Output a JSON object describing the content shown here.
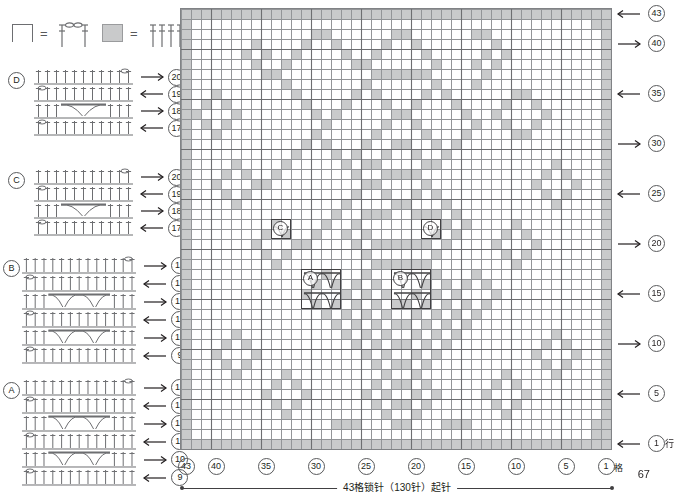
{
  "page": {
    "number": "67"
  },
  "legend": {
    "items": [
      {
        "symbol_name": "open-square-symbol",
        "equals": "=",
        "stitch_name": "chain-and-double-crochet-group"
      },
      {
        "symbol_name": "filled-square-symbol",
        "equals": "=",
        "stitch_name": "four-double-crochet-group"
      }
    ]
  },
  "diagrams": [
    {
      "id": "D",
      "label": "D",
      "rows": [
        {
          "num": "20",
          "dir": "right"
        },
        {
          "num": "19",
          "dir": "left"
        },
        {
          "num": "18",
          "dir": "right"
        },
        {
          "num": "17",
          "dir": "left"
        }
      ]
    },
    {
      "id": "C",
      "label": "C",
      "rows": [
        {
          "num": "20",
          "dir": "right"
        },
        {
          "num": "19",
          "dir": "left"
        },
        {
          "num": "18",
          "dir": "right"
        },
        {
          "num": "17",
          "dir": "left"
        }
      ]
    },
    {
      "id": "B",
      "label": "B",
      "rows": [
        {
          "num": "14",
          "dir": "right"
        },
        {
          "num": "13",
          "dir": "left"
        },
        {
          "num": "12",
          "dir": "right"
        },
        {
          "num": "11",
          "dir": "left"
        },
        {
          "num": "10",
          "dir": "right"
        },
        {
          "num": "9",
          "dir": "left"
        }
      ]
    },
    {
      "id": "A",
      "label": "A",
      "rows": [
        {
          "num": "14",
          "dir": "right"
        },
        {
          "num": "13",
          "dir": "left"
        },
        {
          "num": "12",
          "dir": "right"
        },
        {
          "num": "11",
          "dir": "left"
        },
        {
          "num": "10",
          "dir": "right"
        },
        {
          "num": "9",
          "dir": "left"
        }
      ]
    }
  ],
  "chart_grid": {
    "columns": 43,
    "rows": 44,
    "cell_px": 10,
    "fill_color": "#c9cacb",
    "line_color": "#939598",
    "border_color": "#808285",
    "row_numbers_right": [
      {
        "num": "43",
        "row": 44,
        "dir": "left"
      },
      {
        "num": "40",
        "row": 41,
        "dir": "right"
      },
      {
        "num": "35",
        "row": 36,
        "dir": "left"
      },
      {
        "num": "30",
        "row": 31,
        "dir": "right"
      },
      {
        "num": "25",
        "row": 26,
        "dir": "left"
      },
      {
        "num": "20",
        "row": 21,
        "dir": "right"
      },
      {
        "num": "15",
        "row": 16,
        "dir": "left"
      },
      {
        "num": "10",
        "row": 11,
        "dir": "right"
      },
      {
        "num": "5",
        "row": 6,
        "dir": "left"
      },
      {
        "num": "1",
        "row": 1,
        "dir": "left",
        "suffix": "行"
      }
    ],
    "column_numbers_bottom": [
      {
        "num": "43",
        "col": 43
      },
      {
        "num": "40",
        "col": 40
      },
      {
        "num": "35",
        "col": 35
      },
      {
        "num": "30",
        "col": 30
      },
      {
        "num": "25",
        "col": 25
      },
      {
        "num": "20",
        "col": 20
      },
      {
        "num": "15",
        "col": 15
      },
      {
        "num": "10",
        "col": 10
      },
      {
        "num": "5",
        "col": 5
      },
      {
        "num": "1",
        "col": 1,
        "suffix": "格"
      }
    ],
    "insets": [
      {
        "id": "D",
        "label": "D",
        "col": 18,
        "row": 22,
        "w": 2,
        "h": 2,
        "pattern": "single-arch"
      },
      {
        "id": "C",
        "label": "C",
        "col": 33,
        "row": 22,
        "w": 2,
        "h": 2,
        "pattern": "single-arch"
      },
      {
        "id": "B",
        "label": "B",
        "col": 19,
        "row": 15,
        "w": 4,
        "h": 4,
        "pattern": "double-arch"
      },
      {
        "id": "A",
        "label": "A",
        "col": 28,
        "row": 15,
        "w": 4,
        "h": 4,
        "pattern": "double-arch"
      }
    ],
    "filled_cells_by_row": {
      "44": [
        1,
        2,
        3,
        4,
        5,
        6,
        7,
        8,
        9,
        10,
        11,
        12,
        13,
        14,
        15,
        16,
        17,
        18,
        19,
        20,
        21,
        22,
        23,
        24,
        25,
        26,
        27,
        28,
        29,
        30,
        31,
        32,
        33,
        34,
        35,
        36,
        37,
        38,
        39,
        40,
        41,
        42,
        43
      ],
      "43": [
        1,
        2,
        43
      ],
      "42": [
        1,
        13,
        14,
        21,
        22,
        29,
        30,
        43
      ],
      "41": [
        1,
        12,
        20,
        23,
        28,
        31,
        36,
        43
      ],
      "40": [
        1,
        11,
        13,
        19,
        24,
        27,
        32,
        35,
        37,
        43
      ],
      "39": [
        1,
        12,
        14,
        18,
        25,
        26,
        33,
        36,
        43
      ],
      "38": [
        1,
        13,
        19,
        20,
        21,
        22,
        23,
        24,
        34,
        35,
        43
      ],
      "37": [
        1,
        14,
        18,
        25,
        33,
        43
      ],
      "36": [
        1,
        9,
        10,
        17,
        19,
        24,
        26,
        32,
        40,
        43
      ],
      "35": [
        1,
        8,
        11,
        16,
        20,
        23,
        27,
        31,
        39,
        41,
        43
      ],
      "34": [
        1,
        7,
        12,
        15,
        21,
        22,
        28,
        30,
        38,
        42,
        43
      ],
      "33": [
        1,
        8,
        11,
        14,
        20,
        23,
        29,
        39,
        41,
        43
      ],
      "32": [
        1,
        9,
        10,
        15,
        19,
        24,
        30,
        40,
        43
      ],
      "31": [
        1,
        16,
        18,
        21,
        22,
        25,
        29,
        31,
        43
      ],
      "30": [
        1,
        17,
        20,
        23,
        26,
        28,
        32,
        43
      ],
      "29": [
        1,
        6,
        18,
        19,
        24,
        25,
        27,
        33,
        38,
        43
      ],
      "28": [
        1,
        5,
        7,
        20,
        21,
        22,
        23,
        26,
        34,
        37,
        39,
        43
      ],
      "27": [
        1,
        4,
        8,
        19,
        24,
        25,
        35,
        36,
        40,
        43
      ],
      "26": [
        1,
        5,
        7,
        18,
        20,
        23,
        26,
        37,
        39,
        43
      ],
      "25": [
        1,
        6,
        17,
        21,
        22,
        27,
        38,
        43
      ],
      "24": [
        1,
        16,
        18,
        19,
        20,
        23,
        24,
        25,
        28,
        43
      ],
      "23": [
        1,
        10,
        15,
        17,
        26,
        29,
        34,
        43
      ],
      "22": [
        1,
        9,
        11,
        16,
        18,
        25,
        27,
        30,
        33,
        35,
        43
      ],
      "21": [
        1,
        8,
        12,
        17,
        19,
        20,
        21,
        22,
        23,
        24,
        26,
        31,
        32,
        36,
        43
      ],
      "20": [
        1,
        9,
        11,
        18,
        25,
        33,
        35,
        43
      ],
      "19": [
        1,
        10,
        19,
        20,
        21,
        22,
        23,
        24,
        34,
        43
      ],
      "18": [
        1,
        14,
        18,
        25,
        29,
        43
      ],
      "17": [
        1,
        13,
        15,
        17,
        19,
        24,
        26,
        28,
        30,
        43
      ],
      "16": [
        1,
        12,
        16,
        18,
        20,
        23,
        25,
        27,
        31,
        43
      ],
      "15": [
        1,
        13,
        15,
        17,
        19,
        21,
        22,
        24,
        26,
        28,
        30,
        43
      ],
      "14": [
        1,
        14,
        16,
        18,
        20,
        23,
        25,
        27,
        29,
        43
      ],
      "13": [
        1,
        15,
        17,
        19,
        21,
        22,
        24,
        26,
        28,
        43
      ],
      "12": [
        1,
        6,
        16,
        18,
        20,
        23,
        25,
        27,
        38,
        43
      ],
      "11": [
        1,
        5,
        7,
        17,
        19,
        21,
        22,
        24,
        26,
        37,
        39,
        43
      ],
      "10": [
        1,
        4,
        8,
        18,
        20,
        23,
        25,
        36,
        40,
        43
      ],
      "9": [
        1,
        5,
        7,
        19,
        21,
        22,
        24,
        37,
        39,
        43
      ],
      "8": [
        1,
        6,
        11,
        20,
        23,
        33,
        38,
        43
      ],
      "7": [
        1,
        10,
        12,
        19,
        21,
        22,
        24,
        32,
        34,
        43
      ],
      "6": [
        1,
        9,
        13,
        18,
        20,
        23,
        25,
        31,
        35,
        43
      ],
      "5": [
        1,
        10,
        12,
        19,
        21,
        22,
        24,
        32,
        34,
        43
      ],
      "4": [
        1,
        11,
        20,
        23,
        33,
        43
      ],
      "3": [
        1,
        2,
        15,
        16,
        17,
        21,
        22,
        26,
        27,
        28,
        43
      ],
      "2": [
        1,
        2,
        43
      ],
      "1": [
        1,
        2,
        3,
        4,
        5,
        6,
        7,
        8,
        9,
        10,
        11,
        12,
        13,
        14,
        15,
        16,
        17,
        18,
        19,
        20,
        21,
        22,
        23,
        24,
        25,
        26,
        27,
        28,
        29,
        30,
        31,
        32,
        33,
        34,
        35,
        36,
        37,
        38,
        39,
        40,
        41,
        42,
        43
      ]
    }
  },
  "caption": {
    "text": "43格锁针（130针）起针"
  }
}
